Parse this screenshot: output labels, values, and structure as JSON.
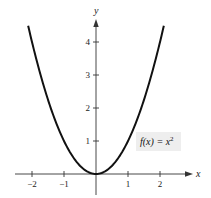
{
  "chart_data": {
    "type": "line",
    "title": "",
    "xlabel": "x",
    "ylabel": "y",
    "xlim": [
      -2.6,
      2.8
    ],
    "ylim": [
      -0.5,
      4.9
    ],
    "grid": false,
    "x_ticks": [
      -2,
      -1,
      1,
      2
    ],
    "x_tick_labels": [
      "−2",
      "−1",
      "1",
      "2"
    ],
    "y_ticks": [
      1,
      2,
      3,
      4
    ],
    "y_tick_labels": [
      "1",
      "2",
      "3",
      "4"
    ],
    "series": [
      {
        "name": "f(x) = x^2",
        "function": "x^2",
        "x_range": [
          -2.12,
          2.12
        ],
        "x": [
          -2.12,
          -2,
          -1.5,
          -1,
          -0.5,
          0,
          0.5,
          1,
          1.5,
          2,
          2.12
        ],
        "y": [
          4.49,
          4,
          2.25,
          1,
          0.25,
          0,
          0.25,
          1,
          2.25,
          4,
          4.49
        ],
        "color": "#111111"
      }
    ],
    "annotations": [
      {
        "text_main": "f(x) = x",
        "superscript": "2",
        "position": "right-middle",
        "background": "#eeeeee"
      }
    ]
  }
}
